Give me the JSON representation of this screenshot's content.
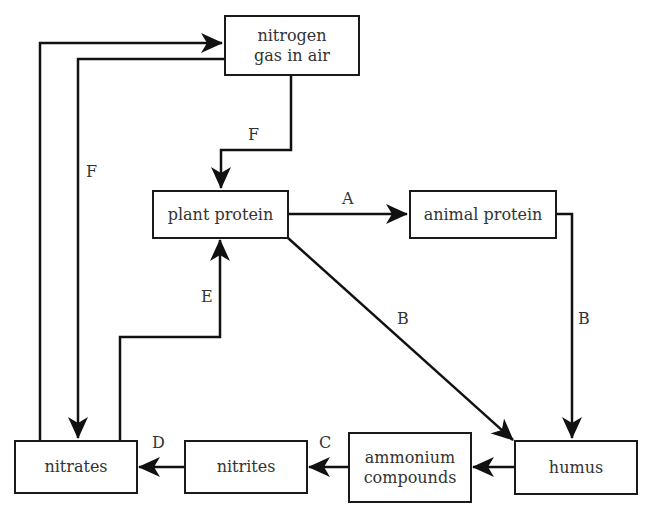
{
  "diagram": {
    "nodes": {
      "nitrogen": {
        "line1": "nitrogen",
        "line2": "gas in air"
      },
      "plant_protein": "plant protein",
      "animal_protein": "animal protein",
      "humus": "humus",
      "ammonium": {
        "line1": "ammonium",
        "line2": "compounds"
      },
      "nitrites": "nitrites",
      "nitrates": "nitrates"
    },
    "labels": {
      "f_top": "F",
      "f_left": "F",
      "a": "A",
      "b_diag": "B",
      "b_right": "B",
      "c": "C",
      "d": "D",
      "e": "E"
    },
    "edges": [
      {
        "from": "nitrogen gas in air",
        "to": "plant protein",
        "label": "F"
      },
      {
        "from": "nitrogen gas in air",
        "to": "nitrates",
        "label": "F"
      },
      {
        "from": "nitrates",
        "to": "nitrogen gas in air",
        "label": ""
      },
      {
        "from": "plant protein",
        "to": "animal protein",
        "label": "A"
      },
      {
        "from": "plant protein",
        "to": "humus",
        "label": "B"
      },
      {
        "from": "animal protein",
        "to": "humus",
        "label": "B"
      },
      {
        "from": "humus",
        "to": "ammonium compounds",
        "label": ""
      },
      {
        "from": "ammonium compounds",
        "to": "nitrites",
        "label": "C"
      },
      {
        "from": "nitrites",
        "to": "nitrates",
        "label": "D"
      },
      {
        "from": "nitrates",
        "to": "plant protein",
        "label": "E"
      }
    ]
  }
}
